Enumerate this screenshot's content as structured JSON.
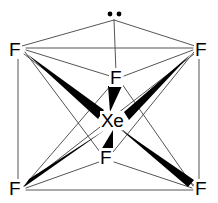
{
  "figure": {
    "molecule_formula": "XeF6",
    "background_color": "#ffffff",
    "line_color": "#555555",
    "bond_color": "#000000",
    "text_color": "#000000",
    "width": 218,
    "height": 203
  },
  "atoms": {
    "central": {
      "label": "Xe",
      "name": "xenon",
      "x": 112,
      "y": 121
    },
    "fluorines": [
      {
        "label": "F",
        "name": "fluorine-top-left",
        "x": 15,
        "y": 50
      },
      {
        "label": "F",
        "name": "fluorine-top-right",
        "x": 201,
        "y": 50
      },
      {
        "label": "F",
        "name": "fluorine-bottom-left",
        "x": 15,
        "y": 189
      },
      {
        "label": "F",
        "name": "fluorine-bottom-right",
        "x": 201,
        "y": 189
      },
      {
        "label": "F",
        "name": "fluorine-upper-center",
        "x": 116,
        "y": 78
      },
      {
        "label": "F",
        "name": "fluorine-lower-center",
        "x": 106,
        "y": 158
      }
    ]
  },
  "lone_pair": {
    "name": "lone-pair",
    "dot_count": 2,
    "apex_x": 114,
    "apex_y": 14,
    "description": "lone pair of electrons on xenon, drawn at apex"
  },
  "bonds": {
    "wedges": [
      {
        "name": "wedge-bond-top-left",
        "from": "fluorine-top-left",
        "to": "central",
        "wide_at": "central"
      },
      {
        "name": "wedge-bond-top-right",
        "from": "fluorine-top-right",
        "to": "central",
        "wide_at": "central"
      },
      {
        "name": "wedge-bond-bottom-left",
        "from": "central",
        "to": "fluorine-bottom-left",
        "wide_at": "fluorine"
      },
      {
        "name": "wedge-bond-bottom-right",
        "from": "central",
        "to": "fluorine-bottom-right",
        "wide_at": "fluorine"
      },
      {
        "name": "wedge-bond-upper-center",
        "from": "fluorine-upper-center",
        "to": "central",
        "wide_at": "fluorine"
      },
      {
        "name": "wedge-bond-lower-center",
        "from": "fluorine-lower-center",
        "to": "central",
        "wide_at": "fluorine"
      }
    ],
    "wedge_count": 6,
    "geometry_outline": "distorted octahedron / capped octahedron drawn as a prism with crossing edges"
  }
}
